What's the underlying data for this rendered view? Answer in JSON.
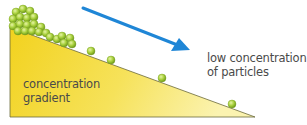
{
  "diagram": {
    "title": "Concentration gradient",
    "gradient_label": [
      "concentration",
      "gradient"
    ],
    "low_label": [
      "low concentration",
      "of particles"
    ],
    "colors": {
      "gradient_fill_left": "#f2d21e",
      "gradient_fill_right": "#fbf3a8",
      "gradient_outline": "#6b6a3a",
      "arrow": "#1f86d6",
      "particle": "#a6cf3a",
      "particle_highlight": "#e2f29a",
      "particle_edge": "#6f9a1c",
      "text": "#4a4a4a"
    },
    "arrow": {
      "from": [
        83,
        8
      ],
      "to": [
        190,
        50
      ],
      "direction": "down-right"
    },
    "particles_cluster": [
      [
        16,
        12
      ],
      [
        23,
        9
      ],
      [
        30,
        11
      ],
      [
        13,
        19
      ],
      [
        20,
        17
      ],
      [
        27,
        18
      ],
      [
        34,
        17
      ],
      [
        13,
        26
      ],
      [
        20,
        24
      ],
      [
        27,
        25
      ],
      [
        34,
        24
      ],
      [
        41,
        27
      ],
      [
        18,
        31
      ],
      [
        25,
        31
      ],
      [
        32,
        31
      ],
      [
        39,
        32
      ],
      [
        46,
        33
      ],
      [
        50,
        37
      ],
      [
        57,
        39
      ],
      [
        62,
        36
      ],
      [
        64,
        43
      ],
      [
        70,
        38
      ],
      [
        72,
        44
      ]
    ],
    "particles_sparse": [
      [
        91,
        51
      ],
      [
        111,
        60
      ],
      [
        162,
        78
      ],
      [
        232,
        104
      ]
    ]
  }
}
